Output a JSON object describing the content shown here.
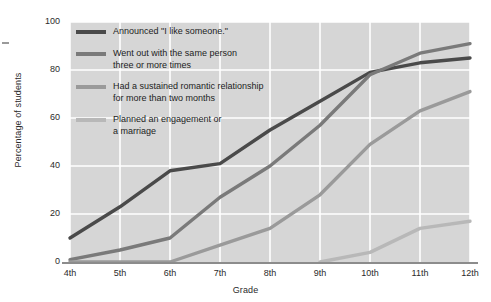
{
  "chart_data": {
    "type": "line",
    "title": "",
    "xlabel": "Grade",
    "ylabel": "Percentage of students",
    "categories": [
      "4th",
      "5th",
      "6th",
      "7th",
      "8th",
      "9th",
      "10th",
      "11th",
      "12th"
    ],
    "x": [
      4,
      5,
      6,
      7,
      8,
      9,
      10,
      11,
      12
    ],
    "ylim": [
      0,
      100
    ],
    "yticks": [
      0,
      20,
      40,
      60,
      80,
      100
    ],
    "ytick_labels": [
      "0",
      "20",
      "40",
      "60",
      "80",
      "100"
    ],
    "grid": true,
    "legend_position": "upper-left-inside",
    "series": [
      {
        "name": "Announced \"I like someone.\"",
        "color": "#4a4a4a",
        "values": [
          10,
          23,
          38,
          41,
          55,
          67,
          79,
          83,
          85
        ]
      },
      {
        "name": "Went out with the same person\nthree or more times",
        "color": "#7a7a7a",
        "values": [
          1,
          5,
          10,
          27,
          40,
          57,
          78,
          87,
          91
        ]
      },
      {
        "name": "Had a sustained romantic relationship\nfor more than two months",
        "color": "#9a9a9a",
        "values": [
          0,
          0,
          0,
          7,
          14,
          28,
          49,
          63,
          71
        ]
      },
      {
        "name": "Planned an engagement or\na marriage",
        "color": "#b8b8b8",
        "values": [
          null,
          null,
          null,
          null,
          null,
          0,
          4,
          14,
          17
        ]
      }
    ]
  },
  "legend": {
    "items": [
      {
        "label": "Announced \"I like someone.\"",
        "color": "#4a4a4a"
      },
      {
        "label": "Went out with the same person\nthree or more times",
        "color": "#7a7a7a"
      },
      {
        "label": "Had a sustained romantic relationship\nfor more than two months",
        "color": "#9a9a9a"
      },
      {
        "label": "Planned an engagement or\na marriage",
        "color": "#b8b8b8"
      }
    ]
  },
  "axes": {
    "y_label": "Percentage of students",
    "x_label": "Grade",
    "y_ticks": [
      "100",
      "80",
      "60",
      "40",
      "20",
      "0"
    ],
    "x_ticks": [
      "4th",
      "5th",
      "6th",
      "7th",
      "8th",
      "9th",
      "10th",
      "11th",
      "12th"
    ]
  },
  "style": {
    "plot_background": "#d6d6d6",
    "grid_color": "#ffffff",
    "axis_color": "#8c8c8c",
    "text_color": "#2b2b2b"
  }
}
